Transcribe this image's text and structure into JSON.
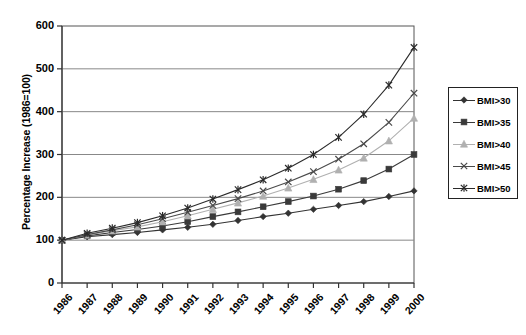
{
  "chart_data": {
    "type": "line",
    "title": "",
    "xlabel": "",
    "ylabel": "Percentage Increase (1986=100)",
    "categories": [
      "1986",
      "1987",
      "1988",
      "1989",
      "1990",
      "1991",
      "1992",
      "1993",
      "1994",
      "1995",
      "1996",
      "1997",
      "1998",
      "1999",
      "2000"
    ],
    "x": [
      "1986",
      "1987",
      "1988",
      "1989",
      "1990",
      "1991",
      "1992",
      "1993",
      "1994",
      "1995",
      "1996",
      "1997",
      "1998",
      "1999",
      "2000"
    ],
    "ylim": [
      0,
      600
    ],
    "yticks": [
      0,
      100,
      200,
      300,
      400,
      500,
      600
    ],
    "ytick_labels": [
      "0",
      "100",
      "200",
      "300",
      "400",
      "500",
      "600"
    ],
    "grid": "horizontal",
    "legend_position": "right",
    "series": [
      {
        "name": "BMI>30",
        "marker": "diamond",
        "color": "#333333",
        "values": [
          100,
          108,
          113,
          118,
          124,
          130,
          137,
          146,
          155,
          163,
          172,
          181,
          190,
          202,
          215
        ]
      },
      {
        "name": "BMI>35",
        "marker": "square",
        "color": "#3a3a3a",
        "values": [
          100,
          110,
          118,
          125,
          133,
          143,
          155,
          166,
          178,
          190,
          203,
          219,
          239,
          266,
          300
        ]
      },
      {
        "name": "BMI>40",
        "marker": "triangle",
        "color": "#b0b0b0",
        "values": [
          100,
          112,
          122,
          131,
          143,
          157,
          172,
          187,
          203,
          222,
          242,
          264,
          292,
          332,
          385
        ]
      },
      {
        "name": "BMI>45",
        "marker": "cross",
        "color": "#4a4a4a",
        "values": [
          100,
          113,
          124,
          136,
          150,
          165,
          181,
          197,
          215,
          236,
          260,
          289,
          325,
          375,
          443
        ]
      },
      {
        "name": "BMI>50",
        "marker": "star",
        "color": "#2a2a2a",
        "values": [
          100,
          116,
          128,
          141,
          157,
          175,
          196,
          218,
          241,
          268,
          300,
          340,
          394,
          462,
          550
        ]
      }
    ]
  },
  "axes": {
    "y_title": "Percentage Increase (1986=100)",
    "y_labels": [
      "600",
      "500",
      "400",
      "300",
      "200",
      "100",
      "0"
    ],
    "x_labels": [
      "1986",
      "1987",
      "1988",
      "1989",
      "1990",
      "1991",
      "1992",
      "1993",
      "1994",
      "1995",
      "1996",
      "1997",
      "1998",
      "1999",
      "2000"
    ]
  },
  "legend": {
    "items": [
      {
        "label": "BMI>30"
      },
      {
        "label": "BMI>35"
      },
      {
        "label": "BMI>40"
      },
      {
        "label": "BMI>45"
      },
      {
        "label": "BMI>50"
      }
    ]
  }
}
